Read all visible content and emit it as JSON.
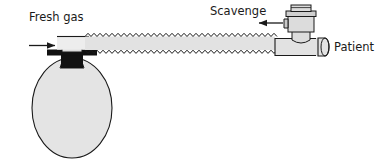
{
  "diagram": {
    "labels": {
      "fresh_gas": "Fresh gas",
      "scavenge": "Scavenge",
      "patient": "Patient"
    },
    "colors": {
      "outline": "#1a1a1a",
      "tube_fill": "#e2e2e2",
      "tube_fill_light": "#ededed",
      "bag_fill": "#e4e4e4",
      "valve_fill": "#dcdcdc",
      "valve_fill_dark": "#c9c9c9",
      "collar_dark": "#111111",
      "background": "#ffffff",
      "text": "#1a1a1a"
    },
    "components": [
      {
        "name": "fresh-gas-inlet-arrow",
        "direction": "right",
        "label": "Fresh gas"
      },
      {
        "name": "reservoir-bag",
        "shape": "ellipse",
        "label": ""
      },
      {
        "name": "bag-neck-collar",
        "shape": "dark-band",
        "label": ""
      },
      {
        "name": "corrugated-tube",
        "shape": "zigzag-tube",
        "label": ""
      },
      {
        "name": "scavenge-valve",
        "shape": "stacked-cylinders",
        "label": "Scavenge"
      },
      {
        "name": "scavenge-arrow",
        "direction": "left",
        "label": ""
      },
      {
        "name": "patient-t-piece",
        "shape": "horizontal-cylinder",
        "label": "Patient"
      }
    ]
  }
}
